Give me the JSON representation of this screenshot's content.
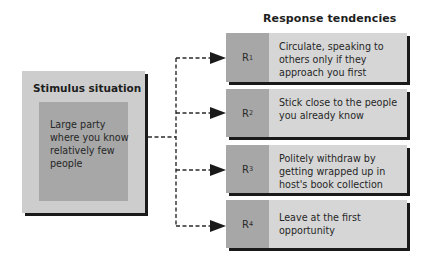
{
  "diagram": {
    "type": "flow",
    "response_heading": "Response tendencies",
    "stimulus": {
      "title": "Stimulus situation",
      "description": "Large party where you know relatively few people"
    },
    "responses": [
      {
        "label": "R",
        "sub": "1",
        "text": "Circulate, speaking to others only if they approach you first"
      },
      {
        "label": "R",
        "sub": "2",
        "text": "Stick close to the people you already know"
      },
      {
        "label": "R",
        "sub": "3",
        "text": "Politely withdraw by getting wrapped up in host's book collection"
      },
      {
        "label": "R",
        "sub": "4",
        "text": "Leave at the first opportunity"
      }
    ],
    "connector_style": "dashed-arrow",
    "colors": {
      "box_light": "#d6d6d6",
      "box_dark": "#a7a7a7",
      "shadow": "#1a1a1a",
      "line": "#2a2a2a"
    }
  }
}
